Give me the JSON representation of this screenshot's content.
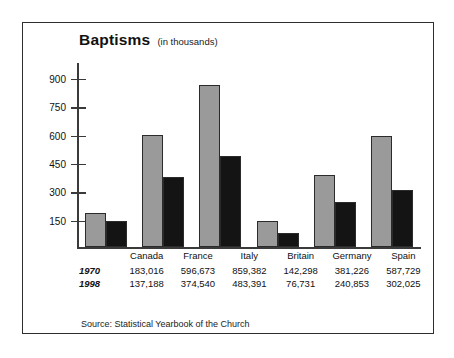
{
  "chart_data": {
    "type": "bar",
    "title": "Baptisms",
    "subtitle": "(in thousands)",
    "xlabel": "",
    "ylabel": "",
    "ylim": [
      0,
      975
    ],
    "yticks": [
      150,
      300,
      450,
      600,
      750,
      900
    ],
    "grid": false,
    "legend_position": "none",
    "categories": [
      "Canada",
      "France",
      "Italy",
      "Britain",
      "Germany",
      "Spain"
    ],
    "series": [
      {
        "name": "1970",
        "color": "#9a9a9a",
        "values": [
          183016,
          596673,
          859382,
          142298,
          381226,
          587729
        ],
        "labels": [
          "183,016",
          "596,673",
          "859,382",
          "142,298",
          "381,226",
          "587,729"
        ]
      },
      {
        "name": "1998",
        "color": "#141414",
        "values": [
          137188,
          374540,
          483391,
          76731,
          240853,
          302025
        ],
        "labels": [
          "137,188",
          "374,540",
          "483,391",
          "76,731",
          "240,853",
          "302,025"
        ]
      }
    ],
    "value_scale_note": "bar heights in thousands; axis labels are thousands",
    "source": "Source: Statistical Yearbook of the Church"
  }
}
